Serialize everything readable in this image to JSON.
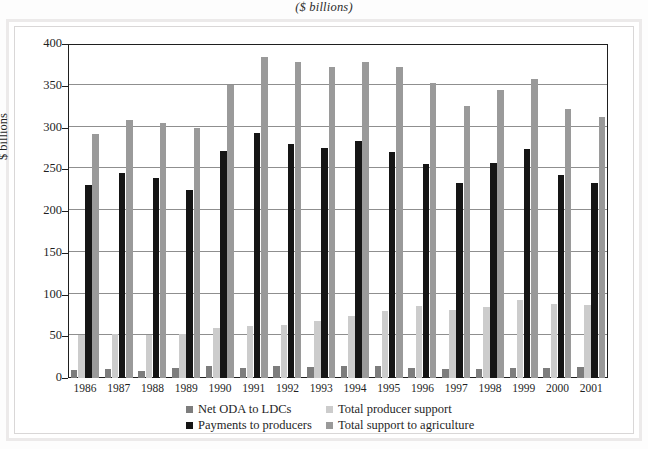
{
  "chart_data": {
    "type": "bar",
    "title": "($ billions)",
    "xlabel": "",
    "ylabel": "$ billions",
    "ylim": [
      0,
      400
    ],
    "yticks": [
      0,
      50,
      100,
      150,
      200,
      250,
      300,
      350,
      400
    ],
    "grid": true,
    "legend_position": "bottom",
    "categories": [
      "1986",
      "1987",
      "1988",
      "1989",
      "1990",
      "1991",
      "1992",
      "1993",
      "1994",
      "1995",
      "1996",
      "1997",
      "1998",
      "1999",
      "2000",
      "2001"
    ],
    "series": [
      {
        "name": "Net ODA to LDCs",
        "color": "#7d7d7d",
        "values": [
          10,
          11,
          8,
          12,
          14,
          12,
          14,
          13,
          14,
          14,
          12,
          11,
          11,
          12,
          12,
          13
        ]
      },
      {
        "name": "Payments to producers",
        "color": "#cccccc",
        "values": [
          52,
          53,
          52,
          53,
          60,
          62,
          64,
          68,
          74,
          80,
          86,
          81,
          85,
          93,
          89,
          88
        ]
      },
      {
        "name": "Total producer support",
        "color": "#151515",
        "values": [
          231,
          246,
          239,
          225,
          272,
          293,
          280,
          275,
          284,
          271,
          256,
          234,
          258,
          274,
          243,
          233
        ]
      },
      {
        "name": "Total support to agriculture",
        "color": "#9a9a9a",
        "values": [
          292,
          309,
          306,
          300,
          351,
          384,
          379,
          372,
          379,
          372,
          353,
          326,
          345,
          358,
          322,
          313
        ]
      }
    ]
  },
  "legend": {
    "entries": [
      {
        "label": "Net ODA to LDCs",
        "series": 0
      },
      {
        "label": "Total producer support",
        "series": 1
      },
      {
        "label": "Payments to producers",
        "series": 2
      },
      {
        "label": "Total support to agriculture",
        "series": 3
      }
    ]
  }
}
